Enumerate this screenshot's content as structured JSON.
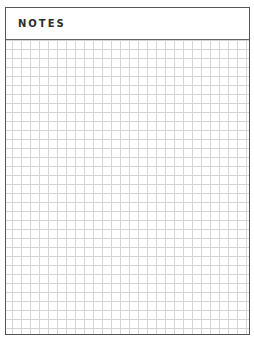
{
  "page": {
    "title": "NOTES",
    "style": {
      "border_color": "#555555",
      "grid_line_color": "#d4d4d4",
      "title_color": "#2e2e2e",
      "background": "#ffffff"
    },
    "grid": {
      "cell_size_px": 9,
      "type": "square-grid"
    }
  }
}
